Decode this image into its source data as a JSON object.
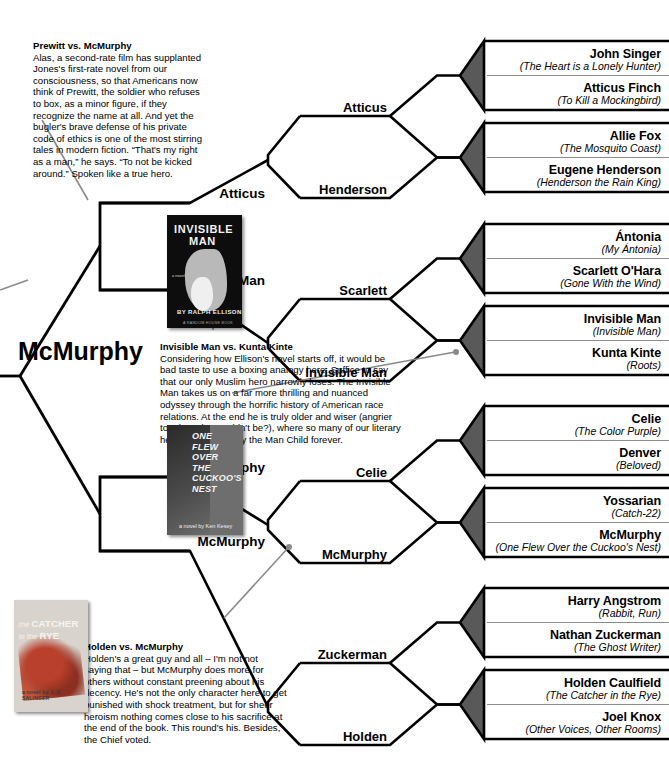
{
  "root": {
    "label": "McMurphy"
  },
  "rounds": {
    "r3": [
      {
        "label": "Atticus"
      },
      {
        "label": "Invisible Man"
      },
      {
        "label": "McMurphy"
      },
      {
        "label": "McMurphy"
      }
    ],
    "r2": [
      {
        "label": "Atticus"
      },
      {
        "label": "Henderson"
      },
      {
        "label": "Scarlett"
      },
      {
        "label": "Invisible Man"
      },
      {
        "label": "Celie"
      },
      {
        "label": "McMurphy"
      },
      {
        "label": "Zuckerman"
      },
      {
        "label": "Holden"
      }
    ]
  },
  "leaves": [
    {
      "name": "John Singer",
      "book": "(The Heart is a Lonely Hunter)"
    },
    {
      "name": "Atticus Finch",
      "book": "(To Kill a Mockingbird)"
    },
    {
      "name": "Allie Fox",
      "book": "(The Mosquito Coast)"
    },
    {
      "name": "Eugene Henderson",
      "book": "(Henderson the Rain King)"
    },
    {
      "name": "Ántonia",
      "book": "(My Ántonia)"
    },
    {
      "name": "Scarlett O'Hara",
      "book": "(Gone With the Wind)"
    },
    {
      "name": "Invisible Man",
      "book": "(Invisible Man)"
    },
    {
      "name": "Kunta Kinte",
      "book": "(Roots)"
    },
    {
      "name": "Celie",
      "book": "(The Color Purple)"
    },
    {
      "name": "Denver",
      "book": "(Beloved)"
    },
    {
      "name": "Yossarian",
      "book": "(Catch-22)"
    },
    {
      "name": "McMurphy",
      "book": "(One Flew Over the Cuckoo's Nest)"
    },
    {
      "name": "Harry Angstrom",
      "book": "(Rabbit, Run)"
    },
    {
      "name": "Nathan Zuckerman",
      "book": "(The Ghost Writer)"
    },
    {
      "name": "Holden Caulfield",
      "book": "(The Catcher in the Rye)"
    },
    {
      "name": "Joel Knox",
      "book": "(Other Voices, Other Rooms)"
    }
  ],
  "notes": [
    {
      "heading": "Prewitt vs. McMurphy",
      "body": "Alas, a second-rate film has supplanted Jones's first-rate novel from our consciousness, so that Americans now think of Prewitt, the soldier who refuses to box, as a minor figure, if they recognize the name at all. And yet the bugler's brave defense of his private code of ethics is one of the most stirring tales in modern fiction. “That's my right as a man,” he says. “To not be kicked around.” Spoken like a true hero."
    },
    {
      "heading": "Invisible Man vs. Kunta Kinte",
      "body": "Considering how Ellison's novel starts off, it would be bad taste to use a boxing analogy here. Suffice to say that our only Muslim hero narrowly loses. The Invisible Man takes us on a far more thrilling and nuanced odyssey through the horrific history of American race relations. At the end he is truly older and wiser (angrier too, but who wouldn't be?), where so many of our literary heroes seem to play the Man Child forever."
    },
    {
      "heading": "Holden vs. McMurphy",
      "body": "Holden's a great guy and all – I'm not not saying that – but McMurphy does more for others without constant preening about his decency. He's not the only character here to get punished with shock treatment, but for sheer heroism nothing comes close to his sacrifice at the end of the book. This round's his. Besides, the Chief voted."
    }
  ],
  "covers": {
    "invisible_man": {
      "title_line1": "INVISIBLE",
      "title_line2": "MAN",
      "small": "a novel",
      "author": "BY RALPH ELLISON",
      "publisher": "A RANDOM HOUSE BOOK"
    },
    "cuckoos_nest": {
      "title": "ONE FLEW OVER THE CUCKOO'S NEST",
      "author": "a novel by  Ken Kesey"
    },
    "catcher_rye": {
      "title_the": "the ",
      "title_catcher": "CATCHER",
      "title_in": "in the ",
      "title_rye": "RYE",
      "author": "a novel by  J. D. SALINGER"
    }
  },
  "colors": {
    "line": "#000000",
    "chevron_fill": "#595959",
    "rule": "#8c8c8c",
    "pointer": "#8a8a8a"
  }
}
